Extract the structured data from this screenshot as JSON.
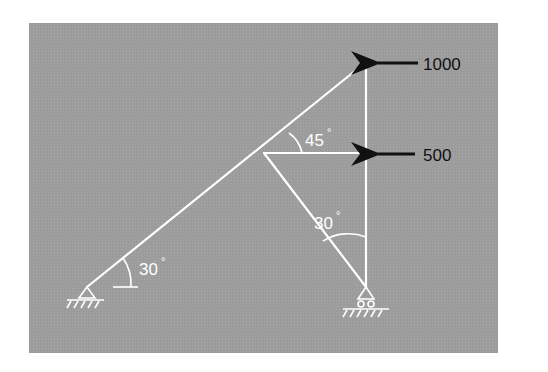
{
  "diagram": {
    "type": "truss",
    "background_color": "#9c9c9c",
    "member_color": "#ffffff",
    "load_color": "#111111",
    "loads": [
      {
        "label": "1000",
        "direction": "left",
        "node": "top"
      },
      {
        "label": "500",
        "direction": "left",
        "node": "middle-right"
      }
    ],
    "angles": [
      {
        "label": "45°",
        "location": "middle-left node, between upper chord and horizontal member"
      },
      {
        "label": "30°",
        "location": "bottom-right support, between diagonal and vertical member"
      },
      {
        "label": "30°",
        "location": "bottom-left support, between inclined member and horizontal"
      }
    ],
    "supports": [
      {
        "type": "pin",
        "location": "bottom-left"
      },
      {
        "type": "roller",
        "location": "bottom-right"
      }
    ]
  }
}
